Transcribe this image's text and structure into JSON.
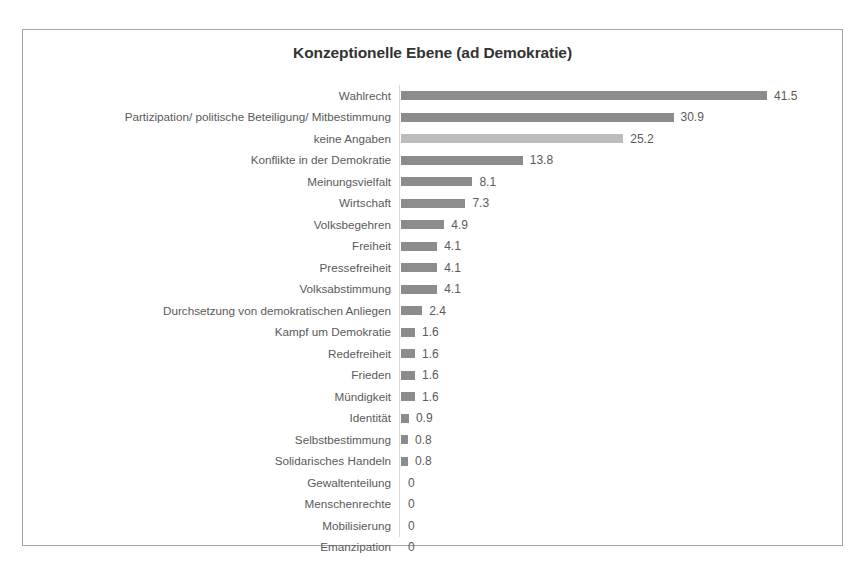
{
  "chart_data": {
    "type": "bar",
    "orientation": "horizontal",
    "title": "Konzeptionelle Ebene (ad Demokratie)",
    "xlabel": "",
    "ylabel": "",
    "xlim": [
      0,
      41.5
    ],
    "grid": false,
    "legend": false,
    "bar_color": "#8c8c8c",
    "highlight_color": "#bdbdbd",
    "categories": [
      "Wahlrecht",
      "Partizipation/ politische Beteiligung/ Mitbestimmung",
      "keine Angaben",
      "Konflikte in der Demokratie",
      "Meinungsvielfalt",
      "Wirtschaft",
      "Volksbegehren",
      "Freiheit",
      "Pressefreiheit",
      "Volksabstimmung",
      "Durchsetzung von demokratischen Anliegen",
      "Kampf um Demokratie",
      "Redefreiheit",
      "Frieden",
      "Mündigkeit",
      "Identität",
      "Selbstbestimmung",
      "Solidarisches Handeln",
      "Gewaltenteilung",
      "Menschenrechte",
      "Mobilisierung",
      "Emanzipation"
    ],
    "values": [
      41.5,
      30.9,
      25.2,
      13.8,
      8.1,
      7.3,
      4.9,
      4.1,
      4.1,
      4.1,
      2.4,
      1.6,
      1.6,
      1.6,
      1.6,
      0.9,
      0.8,
      0.8,
      0,
      0,
      0,
      0
    ],
    "value_labels": [
      "41.5",
      "30.9",
      "25.2",
      "13.8",
      "8.1",
      "7.3",
      "4.9",
      "4.1",
      "4.1",
      "4.1",
      "2.4",
      "1.6",
      "1.6",
      "1.6",
      "1.6",
      "0.9",
      "0.8",
      "0.8",
      "0",
      "0",
      "0",
      "0"
    ],
    "highlighted_categories": [
      "keine Angaben"
    ]
  }
}
